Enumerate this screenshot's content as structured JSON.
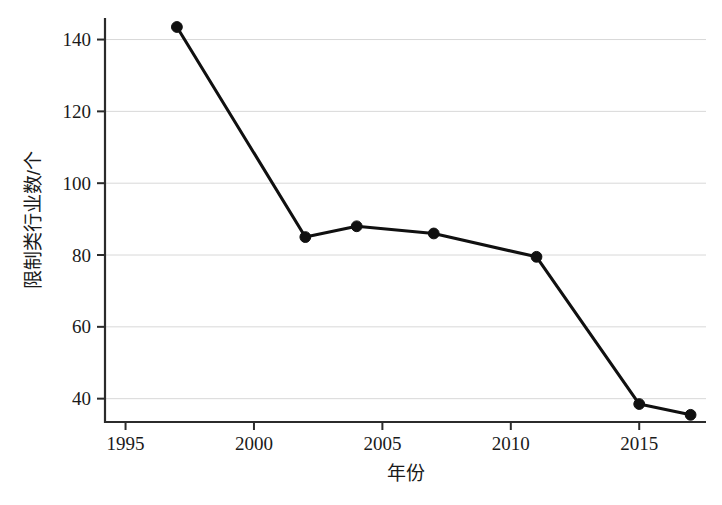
{
  "chart_data": {
    "type": "line",
    "title": "",
    "xlabel": "年份",
    "ylabel": "限制类行业数/个",
    "x": [
      1997,
      2002,
      2004,
      2007,
      2011,
      2015,
      2017
    ],
    "values": [
      143.5,
      85,
      88,
      86,
      79.5,
      38.5,
      35.5
    ],
    "series": [
      {
        "name": "限制类行业数",
        "values": [
          143.5,
          85,
          88,
          86,
          79.5,
          38.5,
          35.5
        ]
      }
    ],
    "xlim": [
      1994.2,
      2017.6
    ],
    "ylim": [
      33.5,
      146
    ],
    "xticks": [
      1995,
      2000,
      2005,
      2010,
      2015
    ],
    "xtick_labels": [
      "1995",
      "2000",
      "2005",
      "2010",
      "2015"
    ],
    "yticks": [
      40,
      60,
      80,
      100,
      120,
      140
    ],
    "ytick_labels": [
      "40",
      "60",
      "80",
      "100",
      "120",
      "140"
    ],
    "grid": "horizontal",
    "legend": "none",
    "marker": "filled-circle",
    "line_color": "#101010",
    "grid_color": "#d8d8d8",
    "axis_color": "#2b2b2b",
    "background_color": "#ffffff"
  },
  "axes": {
    "x_title": "年份",
    "y_title": "限制类行业数/个"
  }
}
